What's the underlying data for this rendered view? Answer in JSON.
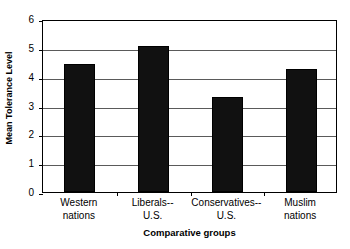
{
  "chart_data": {
    "type": "bar",
    "title": "",
    "xlabel": "Comparative groups",
    "ylabel": "Mean Tolerance Level",
    "categories": [
      "Western nations",
      "Liberals-- U.S.",
      "Conservatives-- U.S.",
      "Muslim nations"
    ],
    "category_lines": [
      [
        "Western",
        "nations"
      ],
      [
        "Liberals--",
        "U.S."
      ],
      [
        "Conservatives--",
        "U.S."
      ],
      [
        "Muslim",
        "nations"
      ]
    ],
    "values": [
      4.45,
      5.05,
      3.3,
      4.25
    ],
    "ylim": [
      0,
      6
    ],
    "yticks": [
      0,
      1,
      2,
      3,
      4,
      5,
      6
    ],
    "ytick_labels": [
      "0",
      "1",
      "2",
      "3",
      "4",
      "5",
      "6"
    ],
    "grid": true,
    "grid_axis": "y",
    "legend": false,
    "legend_position": "none",
    "bar_color": "#111111",
    "bar_edge_color": "#000000",
    "gridline_color": "#5a5a5a",
    "axis_color": "#000000",
    "background_color": "#ffffff"
  }
}
